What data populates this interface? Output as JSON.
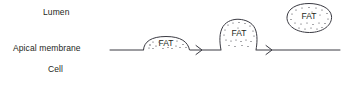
{
  "figure": {
    "background_color": "#ffffff",
    "stroke_color": "#3a3a42",
    "text_color": "#231f20",
    "width": 344,
    "height": 86
  },
  "labels": {
    "lumen": "Lumen",
    "apical_membrane": "Apical membrane",
    "cell": "Cell"
  },
  "membrane": {
    "y": 50,
    "x_start": 110,
    "x_end": 340,
    "leader_from_label_x": 110,
    "leader_to_x": 142
  },
  "vesicles": [
    {
      "id": "stage-1-dome",
      "label": "FAT",
      "stage": "flat dome on membrane",
      "cx": 166,
      "cy": 44,
      "rx": 24,
      "ry": 8,
      "dot_count": 14
    },
    {
      "id": "stage-2-budding",
      "label": "FAT",
      "stage": "budding vesicle",
      "cx": 238,
      "cy": 35,
      "rx": 19,
      "ry": 16,
      "dot_count": 20
    },
    {
      "id": "stage-3-free",
      "label": "FAT",
      "stage": "free vesicle in lumen",
      "cx": 309,
      "cy": 18,
      "rx": 23,
      "ry": 15,
      "dot_count": 22
    }
  ],
  "arrows": [
    {
      "id": "arrow-1",
      "x_start": 192,
      "x_end": 212,
      "y": 50
    },
    {
      "id": "arrow-2",
      "x_start": 262,
      "x_end": 282,
      "y": 50
    }
  ]
}
